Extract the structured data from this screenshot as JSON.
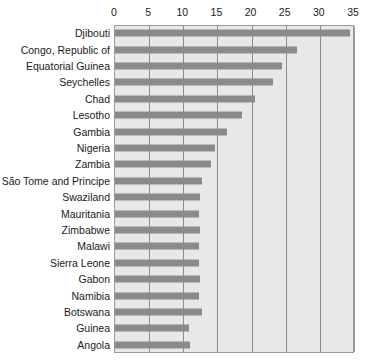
{
  "chart_data": {
    "type": "bar",
    "orientation": "horizontal",
    "title": "",
    "subtitle": "",
    "xlabel": "",
    "ylabel": "",
    "xlim": [
      0,
      35
    ],
    "ylim": null,
    "grid": true,
    "grid_axis": "x",
    "legend": false,
    "legend_position": "none",
    "xticks": [
      0,
      5,
      10,
      15,
      20,
      25,
      30,
      35
    ],
    "xtick_labels": [
      "0",
      "5",
      "10",
      "15",
      "20",
      "25",
      "30",
      "35"
    ],
    "categories": [
      "Djibouti",
      "Congo, Republic of",
      "Equatorial Guinea",
      "Seychelles",
      "Chad",
      "Lesotho",
      "Gambia",
      "Nigeria",
      "Zambia",
      "São Tome and Principe",
      "Swaziland",
      "Mauritania",
      "Zimbabwe",
      "Malawi",
      "Sierra Leone",
      "Gabon",
      "Namibia",
      "Botswana",
      "Guinea",
      "Angola"
    ],
    "values": [
      34.4,
      26.6,
      24.4,
      23.1,
      20.5,
      18.6,
      16.4,
      14.6,
      14.0,
      12.7,
      12.5,
      12.3,
      12.4,
      12.3,
      12.3,
      12.4,
      12.3,
      12.7,
      10.8,
      11.0
    ],
    "bar_color": "#8a8a8a",
    "plot_background": "#e8e8e8",
    "gridline_color": "#8c8c8c",
    "axis_border_color": "#9a9a9a",
    "text_color": "#1a1a1a"
  }
}
